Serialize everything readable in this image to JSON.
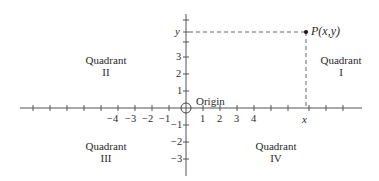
{
  "diagram": {
    "type": "cartesian-coordinate-plane",
    "colors": {
      "axis": "#555555",
      "dashed": "#666666",
      "text": "#2a2a2a",
      "point": "#111111"
    },
    "quadrants": [
      {
        "id": "I",
        "label": "Quadrant",
        "numeral": "I"
      },
      {
        "id": "II",
        "label": "Quadrant",
        "numeral": "II"
      },
      {
        "id": "III",
        "label": "Quadrant",
        "numeral": "III"
      },
      {
        "id": "IV",
        "label": "Quadrant",
        "numeral": "IV"
      }
    ],
    "origin_label": "Origin",
    "point_label": "P(x,y)",
    "x_marker_label": "x",
    "y_marker_label": "y",
    "x_tick_labels": {
      "neg4": "−4",
      "neg3": "−3",
      "neg2": "−2",
      "neg1": "−1",
      "pos1": "1",
      "pos2": "2",
      "pos3": "3",
      "pos4": "4"
    },
    "y_tick_labels": {
      "pos3": "3",
      "pos2": "2",
      "pos1": "1",
      "neg1": "−1",
      "neg2": "−2",
      "neg3": "−3"
    }
  }
}
